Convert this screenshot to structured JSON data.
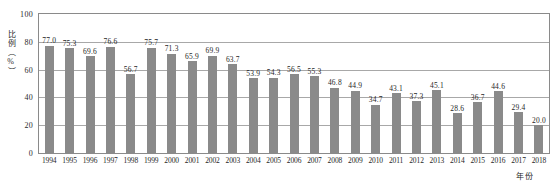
{
  "chart_data": {
    "type": "bar",
    "title": "",
    "xlabel": "年份",
    "ylabel": "比例（%）",
    "ylim": [
      0,
      100
    ],
    "yticks": [
      "0",
      "20",
      "40",
      "60",
      "80",
      "100"
    ],
    "grid": true,
    "legend": "none",
    "bar_color": "#8a8a8a",
    "categories": [
      "1994",
      "1995",
      "1996",
      "1997",
      "1998",
      "1999",
      "2000",
      "2001",
      "2002",
      "2003",
      "2004",
      "2005",
      "2006",
      "2007",
      "2008",
      "2009",
      "2010",
      "2011",
      "2012",
      "2013",
      "2014",
      "2015",
      "2016",
      "2017",
      "2018"
    ],
    "values": [
      77.0,
      75.3,
      69.6,
      76.6,
      56.7,
      75.7,
      71.3,
      65.9,
      69.9,
      63.7,
      53.9,
      54.3,
      56.5,
      55.3,
      46.8,
      44.9,
      34.7,
      43.1,
      37.3,
      45.1,
      28.6,
      36.7,
      44.6,
      29.4,
      20.0
    ],
    "value_labels": [
      "77.0",
      "75.3",
      "69.6",
      "76.6",
      "56.7",
      "75.7",
      "71.3",
      "65.9",
      "69.9",
      "63.7",
      "53.9",
      "54.3",
      "56.5",
      "55.3",
      "46.8",
      "44.9",
      "34.7",
      "43.1",
      "37.3",
      "45.1",
      "28.6",
      "36.7",
      "44.6",
      "29.4",
      "20.0"
    ]
  }
}
